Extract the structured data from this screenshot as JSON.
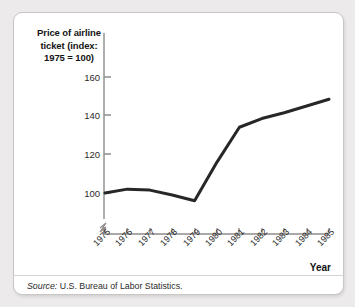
{
  "figure": {
    "y_axis_title": [
      "Price of airline",
      "ticket (index:",
      "1975 = 100)"
    ],
    "x_axis_name": "Year",
    "source_prefix": "Source:",
    "source_text": "U.S. Bureau of Labor Statistics.",
    "line_color": "#272727",
    "axis_color": "#8f8c8a",
    "card_background": "#ffffff",
    "page_background": "#eceaea"
  },
  "chart_data": {
    "type": "line",
    "title": "",
    "xlabel": "Year",
    "ylabel": "Price of airline ticket (index: 1975 = 100)",
    "categories": [
      "1975",
      "1976",
      "1977",
      "1978",
      "1979",
      "1980",
      "1981",
      "1982",
      "1983",
      "1984",
      "1985"
    ],
    "x": [
      1975,
      1976,
      1977,
      1978,
      1979,
      1980,
      1981,
      1982,
      1983,
      1984,
      1985
    ],
    "values": [
      100,
      102,
      101.5,
      99,
      96,
      116,
      134,
      138.5,
      141.5,
      145,
      148.5
    ],
    "yticks": [
      100,
      120,
      140,
      160
    ],
    "ylim": [
      90,
      165
    ],
    "grid": false,
    "legend": false,
    "axis_break": true,
    "series": [
      {
        "name": "Price of airline ticket (index: 1975 = 100)",
        "values": [
          100,
          102,
          101.5,
          99,
          96,
          116,
          134,
          138.5,
          141.5,
          145,
          148.5
        ]
      }
    ]
  }
}
